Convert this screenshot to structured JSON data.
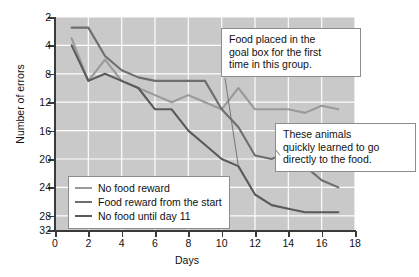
{
  "chart_data": {
    "type": "line",
    "title": "",
    "xlabel": "Days",
    "ylabel": "Number of errors",
    "xlim": [
      0,
      18
    ],
    "ylim": [
      2,
      32
    ],
    "xticks": [
      0,
      2,
      4,
      6,
      8,
      10,
      12,
      14,
      16,
      18
    ],
    "yticks": [
      2,
      4,
      8,
      12,
      16,
      20,
      24,
      28,
      32
    ],
    "grid": true,
    "legend_position": "lower-left-inside",
    "series": [
      {
        "name": "No food reward",
        "color": "#9a9a9a",
        "x": [
          1,
          2,
          3,
          4,
          5,
          6,
          7,
          8,
          9,
          10,
          11,
          12,
          13,
          14,
          15,
          16,
          17
        ],
        "values": [
          29,
          23,
          26,
          23,
          22,
          21,
          20,
          21,
          20,
          19,
          22,
          19,
          19,
          19,
          18.5,
          19.5,
          19
        ]
      },
      {
        "name": "Food reward from the start",
        "color": "#6e6e6e",
        "x": [
          1,
          2,
          3,
          4,
          5,
          6,
          7,
          8,
          9,
          10,
          11,
          12,
          13,
          14,
          15,
          16,
          17
        ],
        "values": [
          30.5,
          30.5,
          26.5,
          24.5,
          23.5,
          23,
          23,
          23,
          23,
          19,
          16.5,
          12.5,
          12,
          13,
          11,
          9,
          8
        ]
      },
      {
        "name": "No food until day 11",
        "color": "#5a5a5a",
        "x": [
          1,
          2,
          3,
          4,
          5,
          6,
          7,
          8,
          9,
          10,
          11,
          12,
          13,
          14,
          15,
          16,
          17
        ],
        "values": [
          28,
          23,
          24,
          23,
          22,
          19,
          19,
          16,
          14,
          12,
          11,
          7,
          5.5,
          5,
          4.5,
          4.5,
          4.5
        ]
      }
    ],
    "annotations": [
      {
        "name": "food-placed-callout",
        "text": "Food placed in the goal box for the first time in this group.",
        "points_to": {
          "x": 11,
          "y": 11
        }
      },
      {
        "name": "quickly-learned-callout",
        "text": "These animals quickly learned to go directly to the food.",
        "points_to": {
          "x": 13.5,
          "y": 12.5
        }
      }
    ]
  },
  "labels": {
    "ylabel": "Number of errors",
    "xlabel": "Days",
    "yticks": [
      "32",
      "28",
      "24",
      "20",
      "16",
      "12",
      "8",
      "4",
      "2"
    ],
    "xticks": [
      "0",
      "2",
      "4",
      "6",
      "8",
      "10",
      "12",
      "14",
      "16",
      "18"
    ]
  },
  "legend": {
    "items": [
      {
        "label": "No food reward"
      },
      {
        "label": "Food reward from the start"
      },
      {
        "label": "No food until day 11"
      }
    ]
  },
  "callouts": {
    "food": {
      "line1": "Food placed in the",
      "line2": "goal box for the first",
      "line3": "time in this group."
    },
    "learned": {
      "line1": "These animals",
      "line2": "quickly learned to go",
      "line3": "directly to the food."
    }
  }
}
